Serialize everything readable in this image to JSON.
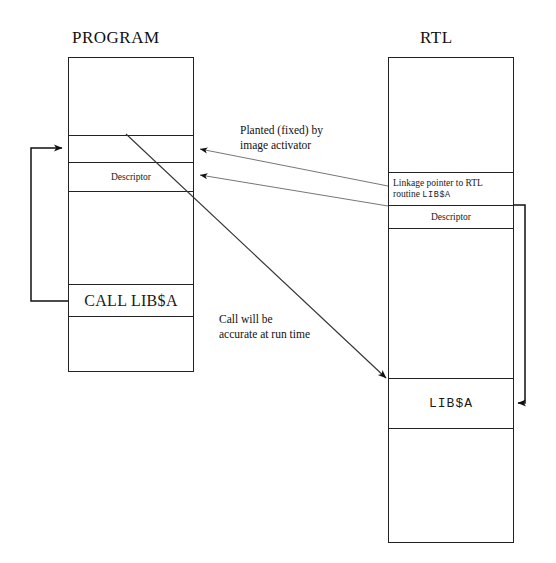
{
  "diagram": {
    "title_program": "PROGRAM",
    "title_rtl": "RTL",
    "program_box": {
      "name": "program-memory-box",
      "cells": [
        {
          "id": "program-cell-top",
          "label": ""
        },
        {
          "id": "program-cell-linkage",
          "label": ""
        },
        {
          "id": "program-cell-descriptor",
          "label": "Descriptor"
        },
        {
          "id": "program-cell-body",
          "label": ""
        },
        {
          "id": "program-cell-call",
          "label": "CALL LIB$A"
        },
        {
          "id": "program-cell-bottom",
          "label": ""
        }
      ]
    },
    "rtl_box": {
      "name": "rtl-memory-box",
      "cells": [
        {
          "id": "rtl-cell-top",
          "label": ""
        },
        {
          "id": "rtl-cell-linkage",
          "label": "Linkage pointer to RTL routine ",
          "label_mono": "LIB$A"
        },
        {
          "id": "rtl-cell-descriptor",
          "label": "Descriptor"
        },
        {
          "id": "rtl-cell-body",
          "label": ""
        },
        {
          "id": "rtl-cell-lib",
          "label": "LIB$A"
        },
        {
          "id": "rtl-cell-bottom",
          "label": ""
        }
      ]
    },
    "annotations": {
      "planted": "Planted (fixed) by\nimage activator",
      "runtime": "Call will be\naccurate at run time"
    },
    "colors": {
      "stroke": "#222222",
      "thin_stroke": "#555555",
      "text": "#1a1a1a",
      "background": "#ffffff"
    }
  }
}
